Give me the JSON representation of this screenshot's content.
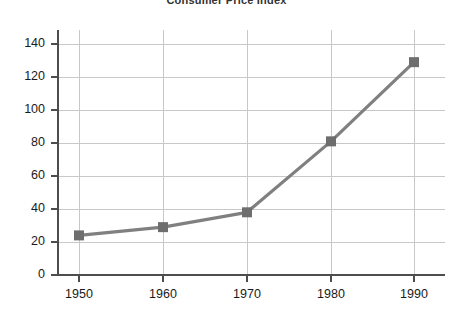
{
  "chart_data": {
    "type": "line",
    "title": "Consumer Price Index",
    "xlabel": "",
    "ylabel": "",
    "x": [
      1950,
      1960,
      1970,
      1980,
      1990
    ],
    "categories": [
      "1950",
      "1960",
      "1970",
      "1980",
      "1990"
    ],
    "values": [
      24,
      29,
      38,
      81,
      129
    ],
    "series": [
      {
        "name": "Consumer Price Index",
        "values": [
          24,
          29,
          38,
          81,
          129
        ]
      }
    ],
    "xlim": [
      1945,
      1995
    ],
    "ylim": [
      0,
      150
    ],
    "x_ticks": [
      "1950",
      "1960",
      "1970",
      "1980",
      "1990"
    ],
    "y_ticks": [
      "0",
      "20",
      "40",
      "60",
      "80",
      "100",
      "120",
      "140"
    ],
    "grid": true,
    "legend": false,
    "marker": "square",
    "line_color": "#808080",
    "marker_color": "#6e6e6e",
    "grid_color": "#c8c8c8",
    "axis_color": "#4d4d4d",
    "background_color": "#ffffff"
  }
}
